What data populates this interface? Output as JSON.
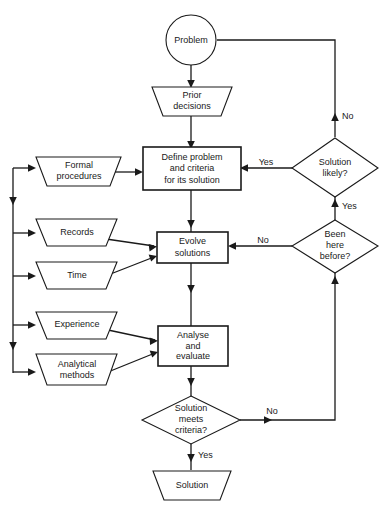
{
  "diagram": {
    "background_color": "#ffffff",
    "line_color": "#1a1a1a",
    "fill_color": "#ffffff"
  },
  "nodes": {
    "problem": {
      "label": "Problem",
      "shape": "circle"
    },
    "prior_decisions": {
      "line1": "Prior",
      "line2": "decisions",
      "shape": "trapezoid-down"
    },
    "define_problem": {
      "line1": "Define problem",
      "line2": "and criteria",
      "line3": "for its solution",
      "shape": "rectangle"
    },
    "formal_procedures": {
      "line1": "Formal",
      "line2": "procedures",
      "shape": "trapezoid-down"
    },
    "records": {
      "line1": "Records",
      "shape": "trapezoid-down"
    },
    "time": {
      "line1": "Time",
      "shape": "trapezoid-down"
    },
    "experience": {
      "line1": "Experience",
      "shape": "trapezoid-down"
    },
    "analytical_methods": {
      "line1": "Analytical",
      "line2": "methods",
      "shape": "trapezoid-down"
    },
    "evolve_solutions": {
      "line1": "Evolve",
      "line2": "solutions",
      "shape": "rectangle"
    },
    "analyse_evaluate": {
      "line1": "Analyse",
      "line2": "and",
      "line3": "evaluate",
      "shape": "rectangle"
    },
    "solution_likely": {
      "line1": "Solution",
      "line2": "likely?",
      "shape": "diamond"
    },
    "been_here_before": {
      "line1": "Been",
      "line2": "here",
      "line3": "before?",
      "shape": "diamond"
    },
    "solution_meets_criteria": {
      "line1": "Solution",
      "line2": "meets",
      "line3": "criteria?",
      "shape": "diamond"
    },
    "solution": {
      "line1": "Solution",
      "shape": "trapezoid-down"
    }
  },
  "edge_labels": {
    "problem_to_solution_likely": "No",
    "solution_likely_yes": "Yes",
    "solution_likely_to_been_here": "Yes",
    "been_here_no": "No",
    "solution_meets_no": "No",
    "solution_meets_yes": "Yes"
  }
}
